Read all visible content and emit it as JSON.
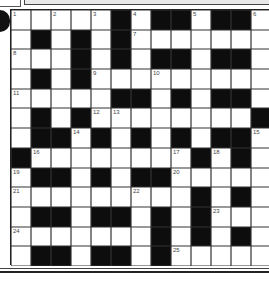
{
  "puzzle": {
    "rows": 13,
    "cols": 13,
    "layout": [
      "W W W W W B W B B W B B W",
      "W B W B W B W W W W W W W",
      "W W W B W B W B B W B B W",
      "W B W B W W W W W W W W W",
      "W W W W W B B W B W B B W",
      "W B W B W W W W W W W W B",
      "W B B W B W B W B W B B W",
      "B W W W W W W W W B W B W",
      "W B B W B W B B W W W W W",
      "W W W W W W W W W B W B W",
      "W B B W B B W B W B W W W",
      "W W W W W W W B W B W B W",
      "W B B W B B W B W W W W W"
    ],
    "numbers": [
      {
        "r": 0,
        "c": 0,
        "n": "1"
      },
      {
        "r": 0,
        "c": 2,
        "n": "2"
      },
      {
        "r": 0,
        "c": 4,
        "n": "3"
      },
      {
        "r": 0,
        "c": 6,
        "n": "4"
      },
      {
        "r": 0,
        "c": 9,
        "n": "5"
      },
      {
        "r": 0,
        "c": 12,
        "n": "6"
      },
      {
        "r": 1,
        "c": 6,
        "n": "7"
      },
      {
        "r": 2,
        "c": 0,
        "n": "8"
      },
      {
        "r": 3,
        "c": 4,
        "n": "9"
      },
      {
        "r": 3,
        "c": 7,
        "n": "10"
      },
      {
        "r": 4,
        "c": 0,
        "n": "11"
      },
      {
        "r": 5,
        "c": 4,
        "n": "12"
      },
      {
        "r": 5,
        "c": 5,
        "n": "13"
      },
      {
        "r": 6,
        "c": 3,
        "n": "14"
      },
      {
        "r": 6,
        "c": 12,
        "n": "15"
      },
      {
        "r": 7,
        "c": 1,
        "n": "16"
      },
      {
        "r": 7,
        "c": 8,
        "n": "17"
      },
      {
        "r": 7,
        "c": 10,
        "n": "18"
      },
      {
        "r": 8,
        "c": 0,
        "n": "19"
      },
      {
        "r": 8,
        "c": 8,
        "n": "20"
      },
      {
        "r": 9,
        "c": 0,
        "n": "21"
      },
      {
        "r": 9,
        "c": 6,
        "n": "22"
      },
      {
        "r": 10,
        "c": 10,
        "n": "23"
      },
      {
        "r": 11,
        "c": 0,
        "n": "24"
      },
      {
        "r": 12,
        "c": 8,
        "n": "25"
      }
    ]
  },
  "colors": {
    "block": "#0d0d0d",
    "cell": "#ffffff",
    "number": "#444444"
  }
}
